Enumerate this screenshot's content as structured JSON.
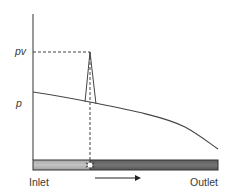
{
  "diagram": {
    "type": "pressure-profile-with-cavitation",
    "labels": {
      "pv": "pv",
      "p": "p",
      "inlet": "Inlet",
      "outlet": "Outlet"
    },
    "colors": {
      "line": "#444444",
      "dashed": "#444444",
      "bar_light": "#b8b8b8",
      "bar_dark": "#6a6a6a",
      "bar_border": "#333333",
      "bubble": "#ffffff",
      "text": "#3a3a3a"
    },
    "flow_direction": "left-to-right"
  }
}
